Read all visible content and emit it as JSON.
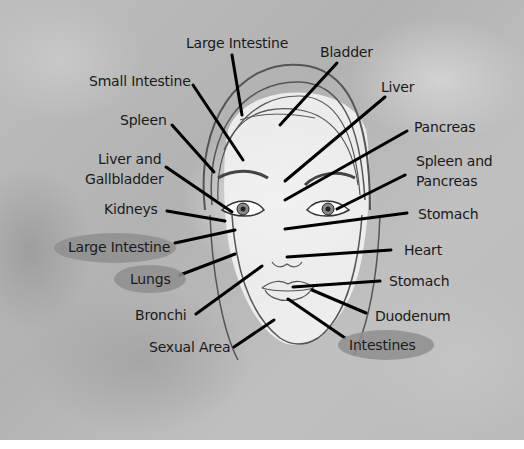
{
  "diagram": {
    "labels": {
      "large_intestine_top": "Large Intestine",
      "bladder": "Bladder",
      "small_intestine": "Small Intestine",
      "liver": "Liver",
      "spleen": "Spleen",
      "pancreas": "Pancreas",
      "liver_gallbladder_line1": "Liver and",
      "liver_gallbladder_line2": "Gallbladder",
      "spleen_pancreas_line1": "Spleen and",
      "spleen_pancreas_line2": "Pancreas",
      "kidneys": "Kidneys",
      "stomach_upper": "Stomach",
      "large_intestine_cheek": "Large Intestine",
      "heart": "Heart",
      "lungs": "Lungs",
      "stomach_lip": "Stomach",
      "bronchi": "Bronchi",
      "duodenum": "Duodenum",
      "sexual_area": "Sexual Area",
      "intestines": "Intestines"
    },
    "highlighted_labels": [
      "Large Intestine (cheek)",
      "Lungs",
      "Intestines"
    ],
    "colors": {
      "background_gray": "#b8b8b8",
      "highlight_oval": "#8e8e8e",
      "leader_line": "#000000",
      "face_skin": "#f2f2f2",
      "outline": "#555555"
    }
  }
}
